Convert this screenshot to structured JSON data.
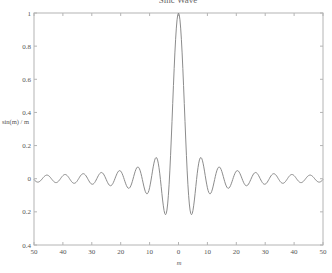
{
  "chart_data": {
    "type": "line",
    "title": "Sinc Wave",
    "xlabel": "m",
    "ylabel": "sin(m) / m",
    "xlim": [
      -50,
      50
    ],
    "ylim": [
      -0.4,
      1
    ],
    "grid": false,
    "legend": null,
    "x_ticks": [
      -50,
      -40,
      -30,
      -20,
      -10,
      0,
      10,
      20,
      30,
      40,
      50
    ],
    "x_tick_labels": [
      "50",
      "40",
      "30",
      "20",
      "10",
      "0",
      "10",
      "20",
      "30",
      "40",
      "50"
    ],
    "y_ticks": [
      -0.4,
      -0.2,
      0,
      0.2,
      0.4,
      0.6,
      0.8,
      1
    ],
    "y_tick_labels": [
      "0.4",
      "0.2",
      "0",
      "0.2",
      "0.4",
      "0.6",
      "0.8",
      "1"
    ],
    "series": [
      {
        "name": "sin(m)/m",
        "color": "#8c8c8c",
        "function": "sin(m)/m",
        "x_range": [
          -50,
          50
        ],
        "sample_step": 0.25,
        "key_points": [
          {
            "x": 0,
            "y": 1.0
          },
          {
            "x": -4.49,
            "y": -0.217
          },
          {
            "x": 4.49,
            "y": -0.217
          },
          {
            "x": -7.73,
            "y": 0.128
          },
          {
            "x": 7.73,
            "y": 0.128
          },
          {
            "x": -10.9,
            "y": -0.091
          },
          {
            "x": 10.9,
            "y": -0.091
          },
          {
            "x": -50,
            "y": -0.005
          },
          {
            "x": 50,
            "y": -0.005
          }
        ]
      }
    ]
  },
  "colors": {
    "axis": "#b4b4b4",
    "curve": "#8c8c8c",
    "text": "#555555"
  }
}
